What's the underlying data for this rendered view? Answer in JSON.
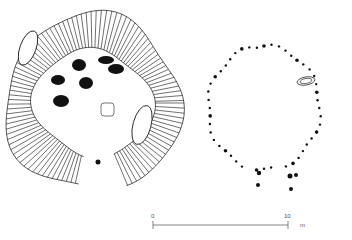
{
  "figure": {
    "type": "archaeological site plan",
    "panels": [
      {
        "id": "enclosure",
        "description": "Hachured ditched enclosure with internal pits and a stone",
        "features": {
          "outer_ring_center": [
            93,
            103
          ],
          "outer_radius": 90,
          "inner_radius": 58,
          "entrance_gap_bearing": "south-east",
          "pits": [
            {
              "cx": 79,
              "cy": 65,
              "rx": 7,
              "ry": 6
            },
            {
              "cx": 58,
              "cy": 80,
              "rx": 7,
              "ry": 5
            },
            {
              "cx": 86,
              "cy": 83,
              "rx": 7,
              "ry": 6
            },
            {
              "cx": 61,
              "cy": 101,
              "rx": 8,
              "ry": 6
            },
            {
              "cx": 106,
              "cy": 60,
              "rx": 8,
              "ry": 4
            },
            {
              "cx": 116,
              "cy": 69,
              "rx": 8,
              "ry": 5
            }
          ],
          "stone": {
            "x": 101,
            "y": 103,
            "w": 13,
            "h": 13
          },
          "terminal_dot": {
            "cx": 98,
            "cy": 162,
            "r": 2.5
          }
        }
      },
      {
        "id": "post-circle",
        "description": "Ring of post-holes / stake-holes with an oval stone",
        "features": {
          "post_count": 48,
          "oval_stone": {
            "cx": 306,
            "cy": 81,
            "rx": 9,
            "ry": 4
          }
        }
      }
    ],
    "scale_bar": {
      "start_label": "0",
      "end_label": "10",
      "unit": "m"
    },
    "colors": {
      "ink": "#111111",
      "background": "#ffffff",
      "scale": "#666666"
    }
  }
}
